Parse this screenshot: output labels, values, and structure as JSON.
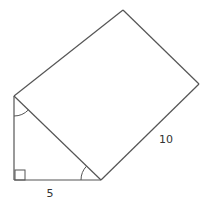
{
  "figure": {
    "type": "right triangle with rectangle on hypotenuse",
    "labels": {
      "base": "5",
      "rectangle_side": "10"
    },
    "markers": {
      "right_angle": "right-angle-square",
      "angle_top": "angle-arc",
      "angle_bottom_right": "angle-arc"
    },
    "stroke_color": "#555555"
  }
}
